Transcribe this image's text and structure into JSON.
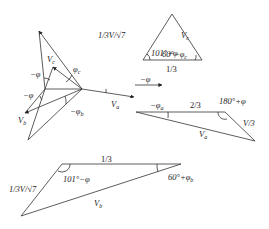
{
  "phasor_diagram": {
    "labels": {
      "vc": "V",
      "vc_sub": "c",
      "phi_c": "φ",
      "phi_c_sub": "c",
      "neg_phi_top": "−φ",
      "neg_phi_left": "−φ",
      "neg_phi_right": "−φ",
      "va": "V",
      "va_sub": "a",
      "vb": "V",
      "vb_sub": "b",
      "neg_phi_b": "−φ",
      "neg_phi_b_sub": "b"
    }
  },
  "triangle_c": {
    "left_side": "1/3V/√7",
    "right_side": "V",
    "right_side_sub": "c",
    "bottom_side": "1/3",
    "angle_left": "101°+φ",
    "angle_right": "60°−φ",
    "angle_right_sub": "c"
  },
  "triangle_a": {
    "top_side": "2/3",
    "right_side": "V/3",
    "bottom_side": "V",
    "bottom_side_sub": "a",
    "angle_left": "−φ",
    "angle_left_sub": "a",
    "angle_right": "180°+φ"
  },
  "triangle_b": {
    "top_side": "1/3",
    "left_side": "1/3V/√7",
    "bottom_side": "V",
    "bottom_side_sub": "b",
    "angle_left": "101°−φ",
    "angle_right": "60°+φ",
    "angle_right_sub": "b"
  }
}
